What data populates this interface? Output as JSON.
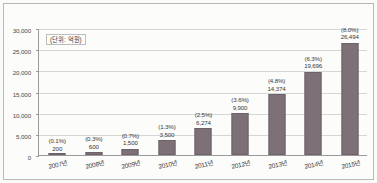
{
  "chart_data": {
    "type": "bar",
    "title": "",
    "subtitle": "",
    "unit_note": "(단위: 억원)",
    "xlabel": "",
    "ylabel": "",
    "ylim": [
      0,
      30000
    ],
    "ytick_step": 5000,
    "grid": true,
    "legend": "none",
    "bar_color": "#7d7076",
    "categories": [
      "2007년",
      "2008년",
      "2009년",
      "2010년",
      "2011년",
      "2012년",
      "2013년",
      "2014년",
      "2015년"
    ],
    "values": [
      200,
      600,
      1500,
      3500,
      6274,
      9900,
      14374,
      19696,
      26494
    ],
    "value_labels": [
      "200",
      "600",
      "1,500",
      "3,500",
      "6,274",
      "9,900",
      "14,374",
      "19,696",
      "26,494"
    ],
    "share_labels": [
      "(0.1%)",
      "(0.3%)",
      "(0.7%)",
      "(1.3%)",
      "(2.5%)",
      "(3.6%)",
      "(4.8%)",
      "(6.3%)",
      "(8.0%)"
    ],
    "shares_percent": [
      0.1,
      0.3,
      0.7,
      1.3,
      2.5,
      3.6,
      4.8,
      6.3,
      8.0
    ],
    "ytick_labels": [
      "0",
      "5,000",
      "10,000",
      "15,000",
      "20,000",
      "25,000",
      "30,000"
    ],
    "ytick_values": [
      0,
      5000,
      10000,
      15000,
      20000,
      25000,
      30000
    ]
  }
}
